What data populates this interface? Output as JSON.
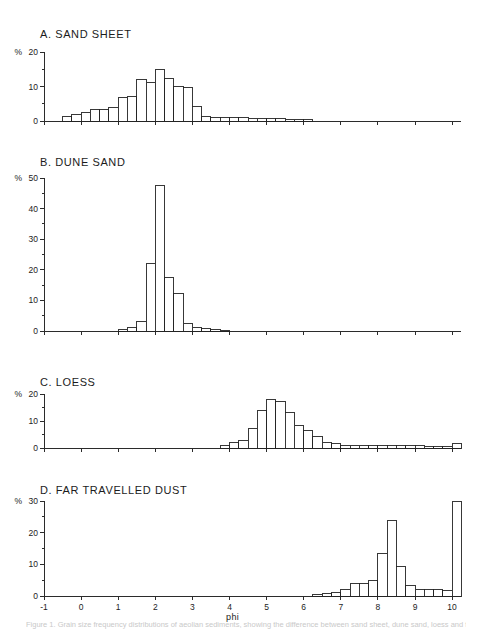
{
  "figure": {
    "xlabel": "phi",
    "caption": "Figure 1. Grain size frequency distributions of aeolian sediments, showing the difference between sand sheet, dune sand, loess and far travelled dust."
  },
  "chart_data": [
    {
      "type": "bar",
      "title": "A. SAND SHEET",
      "panel_letter": "A",
      "xlabel": "phi",
      "ylabel": "%",
      "xlim": [
        -1,
        10.5
      ],
      "ylim": [
        0,
        20
      ],
      "yticks": [
        0,
        10,
        20
      ],
      "yticklabels": [
        "0",
        "10",
        "20"
      ],
      "yminor": [
        5,
        15
      ],
      "xticks": [
        -1,
        0,
        1,
        2,
        3,
        4,
        5,
        6,
        7,
        8,
        9,
        10
      ],
      "bin_width": 0.25,
      "grid": false,
      "x": [
        -0.5,
        -0.25,
        0,
        0.25,
        0.5,
        0.75,
        1,
        1.25,
        1.5,
        1.75,
        2,
        2.25,
        2.5,
        2.75,
        3,
        3.25,
        3.5,
        3.75,
        4,
        4.25,
        4.5,
        4.75,
        5,
        5.25,
        5.5,
        5.75,
        6
      ],
      "values": [
        1.2,
        1.8,
        2.4,
        3.2,
        3.3,
        3.8,
        6.8,
        7.0,
        11.9,
        11.3,
        15.0,
        12.4,
        10.1,
        9.6,
        4.2,
        1.2,
        0.9,
        0.9,
        0.9,
        0.9,
        0.8,
        0.8,
        0.7,
        0.6,
        0.5,
        0.5,
        0.4
      ]
    },
    {
      "type": "bar",
      "title": "B. DUNE SAND",
      "panel_letter": "B",
      "xlabel": "phi",
      "ylabel": "%",
      "xlim": [
        -1,
        10.5
      ],
      "ylim": [
        0,
        50
      ],
      "yticks": [
        0,
        10,
        20,
        30,
        40,
        50
      ],
      "yticklabels": [
        "0",
        "10",
        "20",
        "30",
        "40",
        "50"
      ],
      "yminor": [
        5,
        15,
        25,
        35,
        45
      ],
      "xticks": [
        -1,
        0,
        1,
        2,
        3,
        4,
        5,
        6,
        7,
        8,
        9,
        10
      ],
      "bin_width": 0.25,
      "grid": false,
      "x": [
        1,
        1.25,
        1.5,
        1.75,
        2,
        2.25,
        2.5,
        2.75,
        3,
        3.25,
        3.5,
        3.75
      ],
      "values": [
        0.5,
        1.0,
        3.0,
        22.2,
        47.5,
        17.5,
        12.4,
        2.6,
        1.2,
        0.8,
        0.5,
        0.3
      ]
    },
    {
      "type": "bar",
      "title": "C. LOESS",
      "panel_letter": "C",
      "xlabel": "phi",
      "ylabel": "%",
      "xlim": [
        -1,
        10.5
      ],
      "ylim": [
        0,
        20
      ],
      "yticks": [
        0,
        10,
        20
      ],
      "yticklabels": [
        "0",
        "10",
        "20"
      ],
      "yminor": [
        5,
        15
      ],
      "xticks": [
        -1,
        0,
        1,
        2,
        3,
        4,
        5,
        6,
        7,
        8,
        9,
        10
      ],
      "bin_width": 0.25,
      "grid": false,
      "x": [
        3.75,
        4,
        4.25,
        4.5,
        4.75,
        5,
        5.25,
        5.5,
        5.75,
        6,
        6.25,
        6.5,
        6.75,
        7,
        7.25,
        7.5,
        7.75,
        8,
        8.25,
        8.5,
        8.75,
        9,
        9.25,
        9.5,
        9.75,
        10
      ],
      "values": [
        0.9,
        1.9,
        2.7,
        7.4,
        13.9,
        18.1,
        17.3,
        13.0,
        8.5,
        6.5,
        4.2,
        2.2,
        1.6,
        1.0,
        1.0,
        1.0,
        0.9,
        0.9,
        0.9,
        0.8,
        0.8,
        0.8,
        0.7,
        0.7,
        0.6,
        1.7
      ]
    },
    {
      "type": "bar",
      "title": "D. FAR TRAVELLED DUST",
      "panel_letter": "D",
      "xlabel": "phi",
      "ylabel": "%",
      "xlim": [
        -1,
        10.5
      ],
      "ylim": [
        0,
        30
      ],
      "yticks": [
        0,
        10,
        20,
        30
      ],
      "yticklabels": [
        "0",
        "10",
        "20",
        "30"
      ],
      "yminor": [
        5,
        15,
        25
      ],
      "xticks": [
        -1,
        0,
        1,
        2,
        3,
        4,
        5,
        6,
        7,
        8,
        9,
        10
      ],
      "bin_width": 0.25,
      "grid": false,
      "x": [
        6.25,
        6.5,
        6.75,
        7,
        7.25,
        7.5,
        7.75,
        8,
        8.25,
        8.5,
        8.75,
        9,
        9.25,
        9.5,
        9.75,
        10
      ],
      "values": [
        0.4,
        0.8,
        1.0,
        2.2,
        4.0,
        3.9,
        5.0,
        13.5,
        23.7,
        9.2,
        3.4,
        2.2,
        1.9,
        1.9,
        1.8,
        30.0
      ]
    }
  ]
}
